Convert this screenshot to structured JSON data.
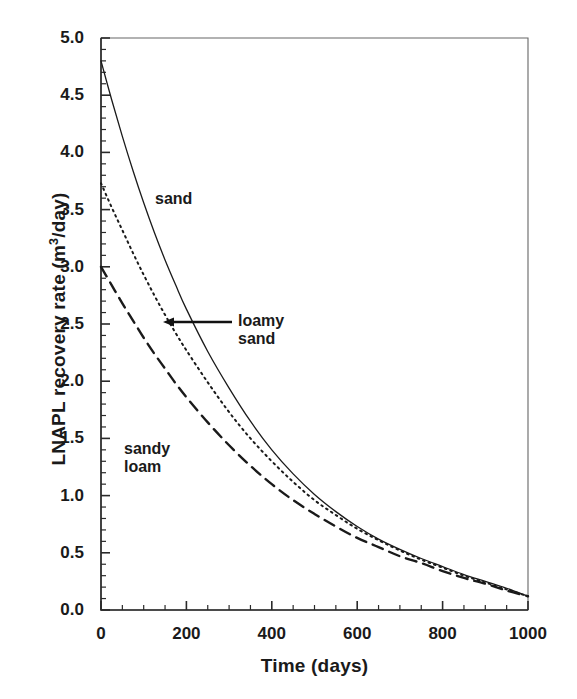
{
  "chart_data": {
    "type": "line",
    "title": "",
    "xlabel": "Time (days)",
    "ylabel": "LNAPL recovery rate (m3/day)",
    "ylabel_pre": "LNAPL recovery rate (m",
    "ylabel_sup": "3",
    "ylabel_post": "/day)",
    "xlim": [
      0,
      1000
    ],
    "ylim": [
      0,
      5.0
    ],
    "xticks": [
      0,
      200,
      400,
      600,
      800,
      1000
    ],
    "xtick_labels": [
      "0",
      "200",
      "400",
      "600",
      "800",
      "1000"
    ],
    "yticks": [
      0.0,
      0.5,
      1.0,
      1.5,
      2.0,
      2.5,
      3.0,
      3.5,
      4.0,
      4.5,
      5.0
    ],
    "ytick_labels": [
      "0.0",
      "0.5",
      "1.0",
      "1.5",
      "2.0",
      "2.5",
      "3.0",
      "3.5",
      "4.0",
      "4.5",
      "5.0"
    ],
    "x_minor_step": 50,
    "y_minor_step": 0.1,
    "grid": false,
    "legend": "inline annotations with leader arrow",
    "line_color": "#1a1a1a",
    "x": [
      0,
      25,
      50,
      75,
      100,
      125,
      150,
      175,
      200,
      250,
      300,
      350,
      400,
      450,
      500,
      550,
      600,
      650,
      700,
      750,
      800,
      850,
      900,
      950,
      1000
    ],
    "series": [
      {
        "name": "sand",
        "style": "solid",
        "values": [
          4.8,
          4.46,
          4.14,
          3.84,
          3.56,
          3.3,
          3.06,
          2.84,
          2.63,
          2.26,
          1.94,
          1.65,
          1.4,
          1.19,
          1.01,
          0.86,
          0.73,
          0.62,
          0.53,
          0.45,
          0.38,
          0.31,
          0.25,
          0.19,
          0.12
        ]
      },
      {
        "name": "loamy sand",
        "style": "dotted",
        "values": [
          3.73,
          3.52,
          3.32,
          3.12,
          2.93,
          2.75,
          2.58,
          2.42,
          2.27,
          1.99,
          1.73,
          1.5,
          1.3,
          1.12,
          0.96,
          0.83,
          0.71,
          0.61,
          0.52,
          0.44,
          0.37,
          0.3,
          0.24,
          0.18,
          0.12
        ]
      },
      {
        "name": "sandy loam",
        "style": "dashed",
        "values": [
          3.0,
          2.84,
          2.68,
          2.53,
          2.38,
          2.24,
          2.11,
          1.98,
          1.86,
          1.64,
          1.44,
          1.26,
          1.1,
          0.96,
          0.84,
          0.73,
          0.63,
          0.55,
          0.47,
          0.41,
          0.34,
          0.28,
          0.23,
          0.17,
          0.12
        ]
      }
    ],
    "annotations": [
      {
        "text": "sand",
        "x_px": 155,
        "y_px": 190,
        "series": "sand"
      },
      {
        "text": "loamy\nsand",
        "x_px": 238,
        "y_px": 312,
        "series": "loamy sand",
        "arrow": true
      },
      {
        "text": "sandy\nloam",
        "x_px": 124,
        "y_px": 440,
        "series": "sandy loam"
      }
    ],
    "arrow": {
      "from_x_px": 232,
      "to_x_px": 163,
      "y_px": 322,
      "direction": "left"
    }
  }
}
